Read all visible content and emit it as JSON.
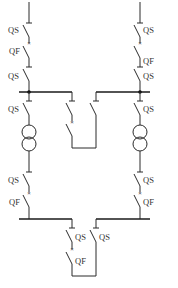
{
  "diagram": {
    "title": "",
    "type": "electrical single-line diagram (sectionalized busbar with two transformers)",
    "colors": {
      "line": "#2b2b2b",
      "background": "#ffffff"
    },
    "labels": {
      "l_qs1": "QS",
      "l_qf1": "QF",
      "l_qs2": "QS",
      "r_qs1": "QS",
      "r_qf1": "QF",
      "r_qs2": "QS",
      "l_qs3": "QS",
      "r_qs3": "QS",
      "l_qs4": "QS",
      "l_qf2": "QF",
      "r_qs4": "QS",
      "r_qf2": "QF",
      "tie_qs_a": "QS",
      "tie_qf": "QF",
      "tie_qs_b": "QS"
    },
    "components": [
      {
        "id": "left-incoming-isolator",
        "type": "QS"
      },
      {
        "id": "left-incoming-breaker",
        "type": "QF"
      },
      {
        "id": "left-bus-isolator",
        "type": "QS"
      },
      {
        "id": "right-incoming-isolator",
        "type": "QS"
      },
      {
        "id": "right-incoming-breaker",
        "type": "QF"
      },
      {
        "id": "right-bus-isolator",
        "type": "QS"
      },
      {
        "id": "upper-bus-tie-breaker",
        "type": "QF"
      },
      {
        "id": "upper-bus-tie-isolator",
        "type": "QS"
      },
      {
        "id": "left-transformer",
        "type": "two-winding transformer"
      },
      {
        "id": "right-transformer",
        "type": "two-winding transformer"
      },
      {
        "id": "left-lv-isolator",
        "type": "QS"
      },
      {
        "id": "left-lv-breaker",
        "type": "QF"
      },
      {
        "id": "right-lv-isolator",
        "type": "QS"
      },
      {
        "id": "right-lv-breaker",
        "type": "QF"
      },
      {
        "id": "lower-bus-tie-isolator-a",
        "type": "QS"
      },
      {
        "id": "lower-bus-tie-breaker",
        "type": "QF"
      },
      {
        "id": "lower-bus-tie-isolator-b",
        "type": "QS"
      }
    ]
  }
}
